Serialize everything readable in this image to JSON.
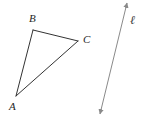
{
  "figure": {
    "background_color": "#ffffff",
    "width": 145,
    "height": 122
  },
  "triangle": {
    "name": "triangle-ABC",
    "stroke_color": "#333333",
    "stroke_width": 1,
    "fill": "none",
    "vertices": [
      {
        "label": "A",
        "x": 16,
        "y": 96,
        "label_x": 9,
        "label_y": 101
      },
      {
        "label": "B",
        "x": 33,
        "y": 30,
        "label_x": 29,
        "label_y": 13
      },
      {
        "label": "C",
        "x": 78,
        "y": 41,
        "label_x": 83,
        "label_y": 34
      }
    ],
    "edges": [
      {
        "name": "edge-AB",
        "from": "A",
        "to": "B"
      },
      {
        "name": "edge-BC",
        "from": "B",
        "to": "C"
      },
      {
        "name": "edge-CA",
        "from": "C",
        "to": "A"
      }
    ]
  },
  "line": {
    "name": "line-l",
    "label": "ℓ",
    "label_x": 130,
    "label_y": 14,
    "stroke_color": "#8a8a8a",
    "stroke_width": 1,
    "arrowheads": "both",
    "start": {
      "x": 100,
      "y": 114
    },
    "end": {
      "x": 127,
      "y": 3
    }
  },
  "labels": {
    "A": "A",
    "B": "B",
    "C": "C",
    "l": "ℓ"
  }
}
